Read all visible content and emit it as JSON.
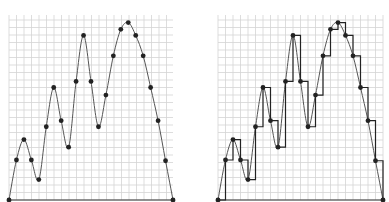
{
  "chart_data": [
    {
      "type": "line",
      "title": "",
      "xlabel": "",
      "ylabel": "",
      "grid": true,
      "description": "Smooth curve interpolating sampled points",
      "x": [
        0,
        1,
        2,
        3,
        4,
        5,
        6,
        7,
        8,
        9,
        10,
        11,
        12,
        13,
        14,
        15,
        16,
        17,
        18,
        19,
        20,
        21,
        22
      ],
      "values": [
        0,
        5.3,
        8,
        5.3,
        2.7,
        9.7,
        14.9,
        10.5,
        7,
        15.7,
        21.8,
        15.7,
        9.7,
        13.9,
        19.1,
        22.6,
        23.5,
        21.8,
        19.1,
        14.9,
        10.5,
        5.2,
        0
      ],
      "ylim": [
        0,
        24.5
      ],
      "xlim": [
        0,
        22
      ]
    },
    {
      "type": "line",
      "title": "",
      "xlabel": "",
      "ylabel": "",
      "grid": true,
      "description": "Same smooth curve with step (sample-and-hold) overlay",
      "series": [
        {
          "name": "curve",
          "style": "smooth"
        },
        {
          "name": "steps",
          "style": "step-after"
        }
      ],
      "x": [
        0,
        1,
        2,
        3,
        4,
        5,
        6,
        7,
        8,
        9,
        10,
        11,
        12,
        13,
        14,
        15,
        16,
        17,
        18,
        19,
        20,
        21,
        22
      ],
      "values": [
        0,
        5.3,
        8,
        5.3,
        2.7,
        9.7,
        14.9,
        10.5,
        7,
        15.7,
        21.8,
        15.7,
        9.7,
        13.9,
        19.1,
        22.6,
        23.5,
        21.8,
        19.1,
        14.9,
        10.5,
        5.2,
        0
      ],
      "ylim": [
        0,
        24.5
      ],
      "xlim": [
        0,
        22
      ]
    }
  ],
  "colors": {
    "grid": "#d4d4d4",
    "curve": "#555555",
    "step": "#222222",
    "point": "#222222"
  }
}
